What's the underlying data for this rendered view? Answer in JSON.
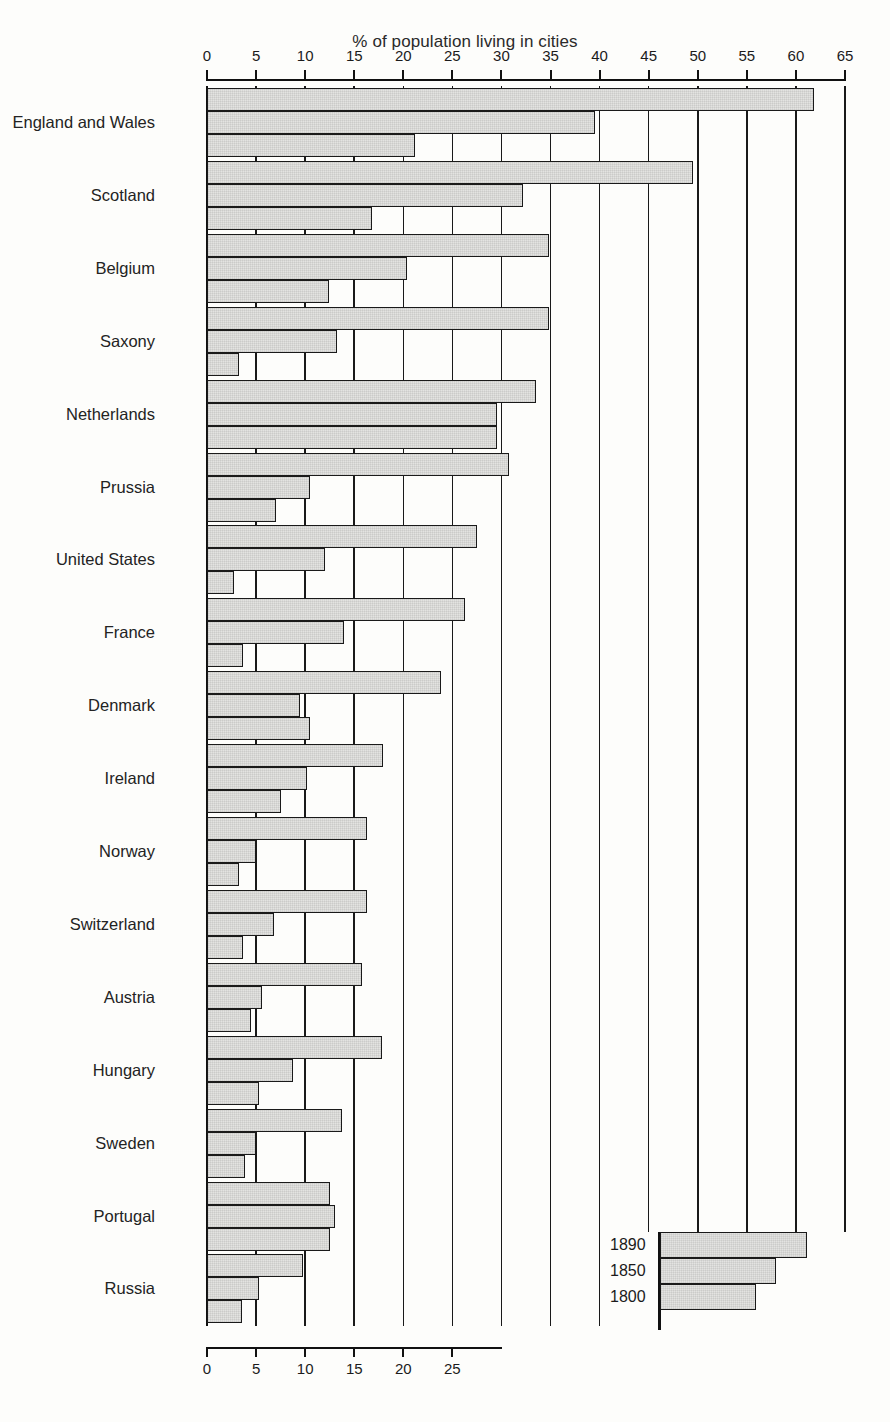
{
  "chart_data": {
    "type": "bar",
    "orientation": "horizontal",
    "title": "% of population living in cities",
    "xlabel": "",
    "ylabel": "",
    "grid": true,
    "top_axis": {
      "xlim": [
        0,
        65
      ],
      "ticks": [
        0,
        5,
        10,
        15,
        20,
        25,
        30,
        35,
        40,
        45,
        50,
        55,
        60,
        65
      ],
      "tick_labels": [
        "0",
        "5",
        "10",
        "15",
        "20",
        "25",
        "30",
        "35",
        "40",
        "45",
        "50",
        "55",
        "60",
        "65"
      ]
    },
    "bottom_axis": {
      "xlim": [
        0,
        30
      ],
      "ticks": [
        0,
        5,
        10,
        15,
        20,
        25
      ],
      "tick_labels": [
        "0",
        "5",
        "10",
        "15",
        "20",
        "25"
      ]
    },
    "legend": {
      "position": "bottom-right",
      "entries": [
        "1890",
        "1850",
        "1800"
      ],
      "sample_values": [
        15.0,
        11.8,
        9.8
      ]
    },
    "categories": [
      "England and Wales",
      "Scotland",
      "Belgium",
      "Saxony",
      "Netherlands",
      "Prussia",
      "United States",
      "France",
      "Denmark",
      "Ireland",
      "Norway",
      "Switzerland",
      "Austria",
      "Hungary",
      "Sweden",
      "Portugal",
      "Russia"
    ],
    "series": [
      {
        "name": "1890",
        "values": [
          61.8,
          49.5,
          34.8,
          34.8,
          33.5,
          30.8,
          27.5,
          26.3,
          23.8,
          17.9,
          16.3,
          16.3,
          15.8,
          17.8,
          13.8,
          12.5,
          9.8
        ]
      },
      {
        "name": "1850",
        "values": [
          39.5,
          32.2,
          20.4,
          13.2,
          29.5,
          10.5,
          12.0,
          14.0,
          9.5,
          10.2,
          5.0,
          6.8,
          5.6,
          8.8,
          5.0,
          13.0,
          5.3
        ]
      },
      {
        "name": "1800",
        "values": [
          21.2,
          16.8,
          12.4,
          3.3,
          29.5,
          7.0,
          2.8,
          3.7,
          10.5,
          7.5,
          3.3,
          3.7,
          4.5,
          5.3,
          3.9,
          12.5,
          3.6
        ]
      }
    ]
  }
}
